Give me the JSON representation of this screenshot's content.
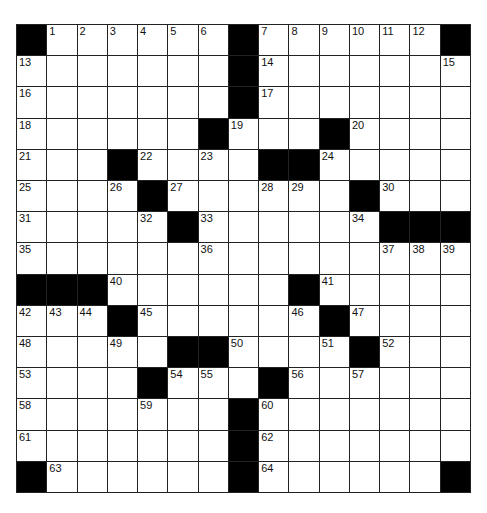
{
  "puzzle": {
    "rows": 15,
    "cols": 15,
    "colors": {
      "block": "#000000",
      "cell": "#ffffff",
      "line": "#222222",
      "number": "#111111"
    },
    "grid": [
      [
        "#",
        "1",
        "2",
        "3",
        "4",
        "5",
        "6",
        "#",
        "7",
        "8",
        "9",
        "10",
        "11",
        "12",
        "#"
      ],
      [
        "13",
        "",
        "",
        "",
        "",
        "",
        "",
        "#",
        "14",
        "",
        "",
        "",
        "",
        "",
        "15"
      ],
      [
        "16",
        "",
        "",
        "",
        "",
        "",
        "",
        "#",
        "17",
        "",
        "",
        "",
        "",
        "",
        ""
      ],
      [
        "18",
        "",
        "",
        "",
        "",
        "",
        "#",
        "19",
        "",
        "",
        "#",
        "20",
        "",
        "",
        ""
      ],
      [
        "21",
        "",
        "",
        "#",
        "22",
        "",
        "23",
        "",
        "#",
        "#",
        "24",
        "",
        "",
        "",
        ""
      ],
      [
        "25",
        "",
        "",
        "26",
        "#",
        "27",
        "",
        "",
        "28",
        "29",
        "",
        "#",
        "30",
        "",
        ""
      ],
      [
        "31",
        "",
        "",
        "",
        "32",
        "#",
        "33",
        "",
        "",
        "",
        "",
        "34",
        "#",
        "#",
        "#"
      ],
      [
        "35",
        "",
        "",
        "",
        "",
        "",
        "36",
        "",
        "",
        "",
        "",
        "",
        "37",
        "38",
        "39"
      ],
      [
        "#",
        "#",
        "#",
        "40",
        "",
        "",
        "",
        "",
        "",
        "#",
        "41",
        "",
        "",
        "",
        ""
      ],
      [
        "42",
        "43",
        "44",
        "#",
        "45",
        "",
        "",
        "",
        "",
        "46",
        "#",
        "47",
        "",
        "",
        ""
      ],
      [
        "48",
        "",
        "",
        "49",
        "",
        "#",
        "#",
        "50",
        "",
        "",
        "51",
        "#",
        "52",
        "",
        ""
      ],
      [
        "53",
        "",
        "",
        "",
        "#",
        "54",
        "55",
        "",
        "#",
        "56",
        "",
        "57",
        "",
        "",
        ""
      ],
      [
        "58",
        "",
        "",
        "",
        "59",
        "",
        "",
        "#",
        "60",
        "",
        "",
        "",
        "",
        "",
        ""
      ],
      [
        "61",
        "",
        "",
        "",
        "",
        "",
        "",
        "#",
        "62",
        "",
        "",
        "",
        "",
        "",
        ""
      ],
      [
        "#",
        "63",
        "",
        "",
        "",
        "",
        "",
        "#",
        "64",
        "",
        "",
        "",
        "",
        "",
        "#"
      ]
    ]
  }
}
